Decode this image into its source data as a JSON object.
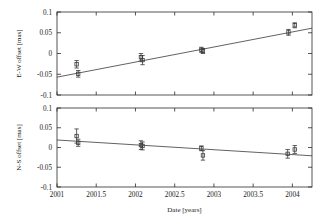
{
  "figure": {
    "xlabel": "Date [years]",
    "background_color": "#ffffff",
    "ink_color": "#2b2b2b"
  },
  "chart_data": [
    {
      "type": "scatter",
      "panel": "top",
      "title": "",
      "xlabel": "",
      "ylabel": "E-W offset [mas]",
      "xlim": [
        2001,
        2004.25
      ],
      "ylim": [
        -0.1,
        0.1
      ],
      "xticks": [
        2001,
        2001.5,
        2002,
        2002.5,
        2003,
        2003.5,
        2004
      ],
      "xticklabels": [
        "2001",
        "2001.5",
        "2002",
        "2002.5",
        "2003",
        "2003.5",
        "2004"
      ],
      "yticks": [
        -0.1,
        -0.05,
        0,
        0.05,
        0.1
      ],
      "yticklabels": [
        "-0.1",
        "-0.05",
        "0",
        "0.05",
        "0.1"
      ],
      "grid": false,
      "legend": "none",
      "points": [
        {
          "x": 2001.25,
          "y": -0.026,
          "yerr": 0.009
        },
        {
          "x": 2001.27,
          "y": -0.049,
          "yerr": 0.008
        },
        {
          "x": 2002.07,
          "y": -0.009,
          "yerr": 0.009
        },
        {
          "x": 2002.09,
          "y": -0.016,
          "yerr": 0.011
        },
        {
          "x": 2002.84,
          "y": 0.009,
          "yerr": 0.006
        },
        {
          "x": 2002.86,
          "y": 0.006,
          "yerr": 0.006
        },
        {
          "x": 2003.95,
          "y": 0.051,
          "yerr": 0.007
        },
        {
          "x": 2004.03,
          "y": 0.068,
          "yerr": 0.006
        }
      ],
      "fit_line": {
        "x": [
          2001,
          2004.25
        ],
        "y": [
          -0.057,
          0.061
        ],
        "slope": 0.0363,
        "intercept_at_2001": -0.057
      }
    },
    {
      "type": "scatter",
      "panel": "bottom",
      "title": "",
      "xlabel": "Date [years]",
      "ylabel": "N-S offset [mas]",
      "xlim": [
        2001,
        2004.25
      ],
      "ylim": [
        -0.1,
        0.1
      ],
      "xticks": [
        2001,
        2001.5,
        2002,
        2002.5,
        2003,
        2003.5,
        2004
      ],
      "xticklabels": [
        "2001",
        "2001.5",
        "2002",
        "2002.5",
        "2003",
        "2003.5",
        "2004"
      ],
      "yticks": [
        -0.1,
        -0.05,
        0,
        0.05,
        0.1
      ],
      "yticklabels": [
        "-0.1",
        "-0.05",
        "0",
        "0.05",
        "0.1"
      ],
      "grid": false,
      "legend": "none",
      "points": [
        {
          "x": 2001.25,
          "y": 0.029,
          "yerr": 0.018
        },
        {
          "x": 2001.27,
          "y": 0.012,
          "yerr": 0.009
        },
        {
          "x": 2002.07,
          "y": 0.006,
          "yerr": 0.011
        },
        {
          "x": 2002.09,
          "y": 0.004,
          "yerr": 0.01
        },
        {
          "x": 2002.84,
          "y": -0.002,
          "yerr": 0.006
        },
        {
          "x": 2002.86,
          "y": -0.02,
          "yerr": 0.012
        },
        {
          "x": 2003.94,
          "y": -0.016,
          "yerr": 0.011
        },
        {
          "x": 2004.03,
          "y": -0.005,
          "yerr": 0.01
        }
      ],
      "fit_line": {
        "x": [
          2001,
          2004.25
        ],
        "y": [
          0.019,
          -0.021
        ],
        "slope": -0.0123,
        "intercept_at_2001": 0.019
      }
    }
  ]
}
